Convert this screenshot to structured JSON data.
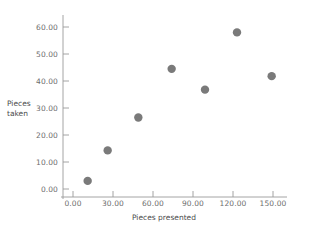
{
  "chart_data": {
    "type": "scatter",
    "title": "",
    "xlabel": "Pieces presented",
    "ylabel": "Pieces taken",
    "xlim": [
      -10,
      165
    ],
    "ylim": [
      -4,
      64
    ],
    "xticks": [
      "0.00",
      "30.00",
      "60.00",
      "90.00",
      "120.00",
      "150.00"
    ],
    "xtick_values": [
      0,
      30,
      60,
      90,
      120,
      150
    ],
    "yticks": [
      "0.00",
      "10.00",
      "20.00",
      "30.00",
      "40.00",
      "50.00",
      "60.00"
    ],
    "ytick_values": [
      0,
      10,
      20,
      30,
      40,
      50,
      60
    ],
    "grid": false,
    "legend": "none",
    "marker": {
      "shape": "circle",
      "color": "#7a7a7a",
      "size": 4.2
    },
    "axis_color": "#9a9a9a",
    "points": [
      {
        "x": 11,
        "y": 3.0
      },
      {
        "x": 26,
        "y": 14.3
      },
      {
        "x": 49,
        "y": 26.5
      },
      {
        "x": 74,
        "y": 44.5
      },
      {
        "x": 99,
        "y": 36.8
      },
      {
        "x": 123,
        "y": 58.0
      },
      {
        "x": 149,
        "y": 41.8
      }
    ],
    "series": [
      {
        "name": "Pieces taken vs Pieces presented",
        "x": [
          11,
          26,
          49,
          74,
          99,
          123,
          149
        ],
        "values": [
          3.0,
          14.3,
          26.5,
          44.5,
          36.8,
          58.0,
          41.8
        ]
      }
    ]
  },
  "axis_titles": {
    "y_line1": "Pieces",
    "y_line2": "taken",
    "x": "Pieces presented"
  }
}
